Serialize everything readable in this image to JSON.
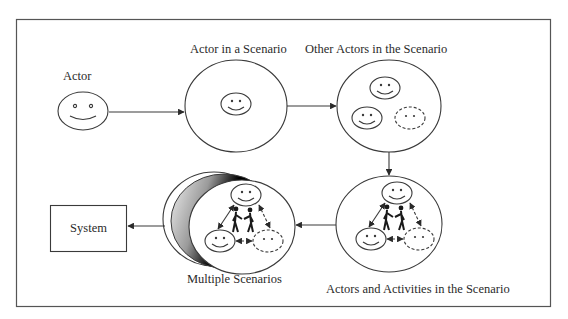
{
  "diagram": {
    "title": "",
    "colors": {
      "line": "#3a3a3a",
      "text": "#2a2a2a",
      "frame": "#555555",
      "background": "#ffffff"
    },
    "nodes": [
      {
        "id": "actor",
        "label": "Actor",
        "shape": "smiley-face"
      },
      {
        "id": "actor-in-scenario",
        "label": "Actor in a Scenario",
        "shape": "circle",
        "contains": [
          "one actor face"
        ]
      },
      {
        "id": "other-actors",
        "label": "Other Actors in the Scenario",
        "shape": "circle",
        "contains": [
          "two solid actor faces",
          "one dashed actor face"
        ]
      },
      {
        "id": "actors-activities",
        "label": "Actors and Activities in the Scenario",
        "shape": "circle",
        "contains": [
          "three actor faces (one dashed)",
          "interaction arrows",
          "two stick figures shaking hands"
        ]
      },
      {
        "id": "multiple-scenarios",
        "label": "Multiple Scenarios",
        "shape": "stacked-circles",
        "contains": [
          "three actor faces (one dashed)",
          "interaction arrows",
          "two stick figures shaking hands"
        ]
      },
      {
        "id": "system",
        "label": "System",
        "shape": "rectangle"
      }
    ],
    "edges": [
      {
        "from": "actor",
        "to": "actor-in-scenario"
      },
      {
        "from": "actor-in-scenario",
        "to": "other-actors"
      },
      {
        "from": "other-actors",
        "to": "actors-activities"
      },
      {
        "from": "actors-activities",
        "to": "multiple-scenarios"
      },
      {
        "from": "multiple-scenarios",
        "to": "system"
      }
    ]
  },
  "labels": {
    "actor": "Actor",
    "actor_in_scenario": "Actor in a Scenario",
    "other_actors": "Other Actors in the Scenario",
    "actors_activities": "Actors and Activities in the Scenario",
    "multiple_scenarios": "Multiple Scenarios",
    "system": "System"
  }
}
